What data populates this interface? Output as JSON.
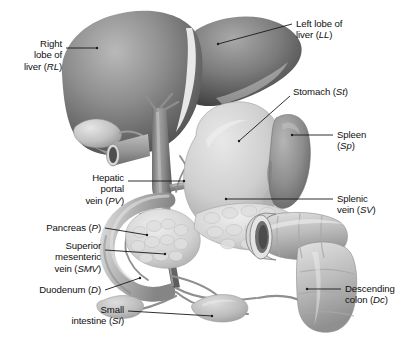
{
  "figure": {
    "kind": "anatomical-illustration",
    "style": "grayscale shaded medical drawing",
    "background_color": "#ffffff",
    "leader_line_color": "#1a1a1a",
    "text_color": "#101010"
  },
  "labels": [
    {
      "id": "right-lobe-liver",
      "text": "Right\nlobe of\nliver (RL)",
      "abbr": "RL",
      "align": "right",
      "x": 62,
      "y": 38,
      "leader": [
        [
          66,
          48
        ],
        [
          97,
          48
        ]
      ]
    },
    {
      "id": "left-lobe-liver",
      "text": "Left lobe of\nliver (LL)",
      "abbr": "LL",
      "align": "left",
      "x": 296,
      "y": 18,
      "leader": [
        [
          292,
          24
        ],
        [
          218,
          44
        ]
      ]
    },
    {
      "id": "stomach",
      "text": "Stomach (St)",
      "abbr": "St",
      "align": "left",
      "x": 293,
      "y": 86,
      "leader": [
        [
          290,
          96
        ],
        [
          239,
          141
        ]
      ]
    },
    {
      "id": "spleen",
      "text": "Spleen\n(Sp)",
      "abbr": "Sp",
      "align": "left",
      "x": 337,
      "y": 129,
      "leader": [
        [
          333,
          135
        ],
        [
          292,
          135
        ]
      ]
    },
    {
      "id": "hepatic-portal-vein",
      "text": "Hepatic\nportal\nvein (PV)",
      "abbr": "PV",
      "align": "right",
      "x": 124,
      "y": 172,
      "leader": [
        [
          128,
          181
        ],
        [
          184,
          181
        ]
      ]
    },
    {
      "id": "splenic-vein",
      "text": "Splenic\nvein (SV)",
      "abbr": "SV",
      "align": "left",
      "x": 337,
      "y": 193,
      "leader": [
        [
          333,
          199
        ],
        [
          226,
          199
        ]
      ]
    },
    {
      "id": "pancreas",
      "text": "Pancreas (P)",
      "abbr": "P",
      "align": "right",
      "x": 101,
      "y": 222,
      "leader": [
        [
          105,
          228
        ],
        [
          147,
          235
        ]
      ]
    },
    {
      "id": "superior-mesenteric-vein",
      "text": "Superior\nmesenteric\nvein (SMV)",
      "abbr": "SMV",
      "align": "right",
      "x": 101,
      "y": 240,
      "leader": [
        [
          105,
          250
        ],
        [
          165,
          254
        ]
      ]
    },
    {
      "id": "duodenum",
      "text": "Duodenum (D)",
      "abbr": "D",
      "align": "right",
      "x": 101,
      "y": 284,
      "leader": [
        [
          105,
          290
        ],
        [
          140,
          278
        ]
      ]
    },
    {
      "id": "small-intestine",
      "text": "Small\nintestine (SI)",
      "abbr": "SI",
      "align": "right",
      "x": 124,
      "y": 304,
      "leader": [
        [
          128,
          311
        ],
        [
          212,
          316
        ]
      ]
    },
    {
      "id": "descending-colon",
      "text": "Descending\ncolon (Dc)",
      "abbr": "Dc",
      "align": "left",
      "x": 345,
      "y": 283,
      "leader": [
        [
          341,
          289
        ],
        [
          307,
          289
        ]
      ]
    }
  ],
  "structures": [
    {
      "id": "liver-right-lobe",
      "name": "Right lobe of liver"
    },
    {
      "id": "liver-left-lobe",
      "name": "Left lobe of liver"
    },
    {
      "id": "gallbladder",
      "name": "Gallbladder"
    },
    {
      "id": "stomach-body",
      "name": "Stomach"
    },
    {
      "id": "spleen-body",
      "name": "Spleen"
    },
    {
      "id": "portal-vein",
      "name": "Hepatic portal vein"
    },
    {
      "id": "splenic-vein-vessel",
      "name": "Splenic vein"
    },
    {
      "id": "smv-vessel",
      "name": "Superior mesenteric vein"
    },
    {
      "id": "pancreas-body",
      "name": "Pancreas"
    },
    {
      "id": "duodenum-loop",
      "name": "Duodenum"
    },
    {
      "id": "small-intestine-loops",
      "name": "Small intestine"
    },
    {
      "id": "descending-colon-body",
      "name": "Descending colon"
    },
    {
      "id": "cut-vessel",
      "name": "Cut great vessel"
    }
  ]
}
